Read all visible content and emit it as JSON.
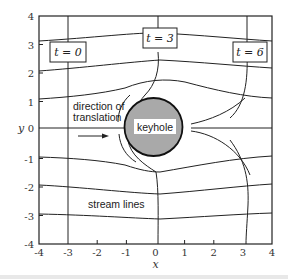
{
  "figure": {
    "type": "diagram",
    "axes": {
      "xlabel": "x",
      "ylabel": "y",
      "xlim": [
        -4,
        4
      ],
      "ylim": [
        -4,
        4
      ],
      "x_ticks": [
        "-4",
        "-3",
        "-2",
        "-1",
        "0",
        "1",
        "2",
        "3",
        "4"
      ],
      "y_ticks": [
        "4",
        "3",
        "2",
        "1",
        "0",
        "-1",
        "-2",
        "-3",
        "-4"
      ]
    },
    "labels": {
      "keyhole": "keyhole",
      "direction_line1": "direction of",
      "direction_line2": "translation",
      "stream_lines": "stream lines"
    },
    "time_markers": [
      {
        "label": "t = 0",
        "x": -3
      },
      {
        "label": "t = 3",
        "x": 0
      },
      {
        "label": "t = 6",
        "x": 3
      }
    ],
    "keyhole": {
      "center": [
        0,
        0
      ],
      "radius": 1,
      "fill_color": "#a9a9a9"
    },
    "stream_line_start_y": [
      3.1,
      2.05,
      1.0,
      0.0,
      -1.0,
      -2.0,
      -3.0
    ]
  }
}
